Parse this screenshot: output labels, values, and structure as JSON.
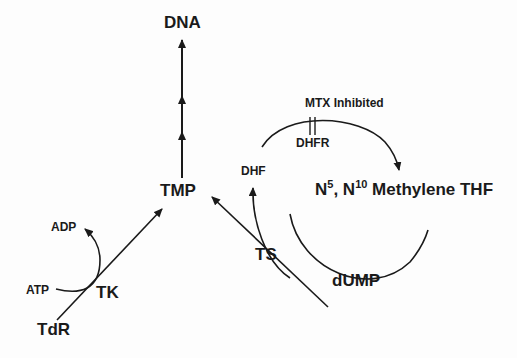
{
  "diagram": {
    "nodes": {
      "dna": "DNA",
      "tmp": "TMP",
      "tdr": "TdR",
      "tk": "TK",
      "atp": "ATP",
      "adp": "ADP",
      "dhf": "DHF",
      "dhfr": "DHFR",
      "mtx": "MTX Inhibited",
      "ts": "TS",
      "dump": "dUMP",
      "methylene_n5": "N",
      "methylene_sup5": "5",
      "methylene_sep": ", N",
      "methylene_sup10": "10",
      "methylene_rest": " Methylene THF"
    },
    "colors": {
      "ink": "#1a1a1a",
      "background": "#fdfdfd"
    }
  }
}
